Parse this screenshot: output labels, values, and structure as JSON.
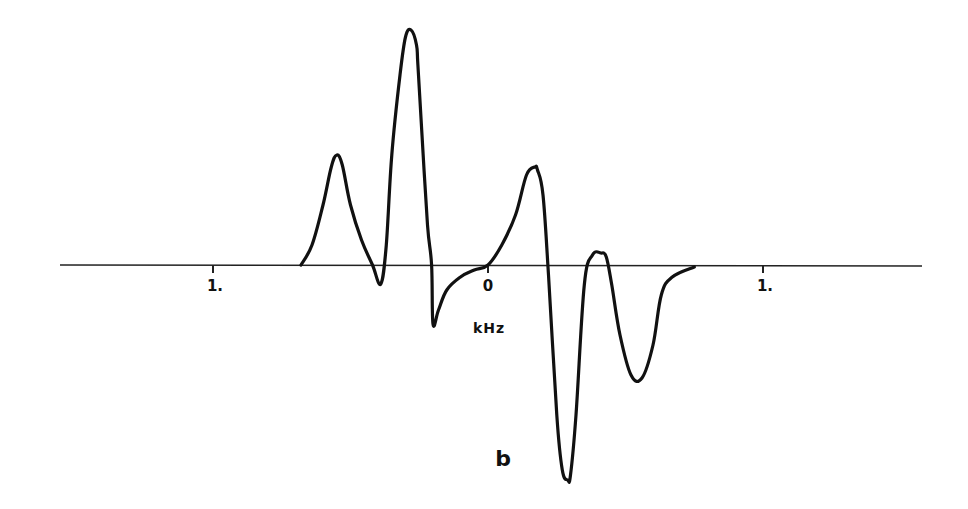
{
  "chart_data": {
    "type": "line",
    "title": "",
    "panel_label": "b",
    "xlabel": "kHz",
    "ylabel": "",
    "xlim": [
      -1.55,
      1.58
    ],
    "ylim": [
      -220,
      240
    ],
    "grid": false,
    "legend": "none",
    "x_ticks": [
      {
        "value": -1,
        "label": "1."
      },
      {
        "value": 0,
        "label": "0"
      },
      {
        "value": 1,
        "label": "1."
      }
    ],
    "series": [
      {
        "name": "spectrum",
        "color": "#111111",
        "x": [
          -0.68,
          -0.64,
          -0.6,
          -0.57,
          -0.55,
          -0.53,
          -0.5,
          -0.46,
          -0.42,
          -0.39,
          -0.37,
          -0.35,
          -0.32,
          -0.3,
          -0.28,
          -0.26,
          -0.255,
          -0.24,
          -0.22,
          -0.205,
          -0.2,
          -0.18,
          -0.15,
          -0.1,
          -0.05,
          0.0,
          0.05,
          0.1,
          0.14,
          0.17,
          0.18,
          0.2,
          0.22,
          0.25,
          0.27,
          0.29,
          0.3,
          0.32,
          0.35,
          0.38,
          0.41,
          0.43,
          0.45,
          0.48,
          0.52,
          0.56,
          0.6,
          0.63,
          0.67,
          0.75
        ],
        "y": [
          0,
          20,
          60,
          98,
          110,
          100,
          60,
          25,
          0,
          -19,
          20,
          110,
          190,
          228,
          235,
          220,
          200,
          130,
          40,
          0,
          -59,
          -45,
          -25,
          -12,
          -5,
          0,
          20,
          50,
          90,
          98,
          95,
          70,
          -10,
          -150,
          -205,
          -215,
          -210,
          -150,
          -20,
          10,
          12,
          8,
          -20,
          -70,
          -110,
          -113,
          -80,
          -30,
          -12,
          -2
        ]
      }
    ]
  }
}
